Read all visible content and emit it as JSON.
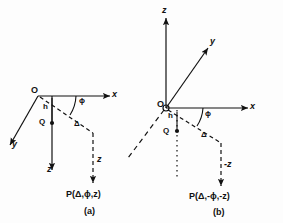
{
  "figure": {
    "background_color": "#fdfdfd",
    "stroke_color": "#111111",
    "panels": [
      {
        "id": "a",
        "caption": "(a)",
        "origin_label": "O",
        "axes": [
          {
            "name": "x-axis",
            "label": "x",
            "direction": "right",
            "style": "solid"
          },
          {
            "name": "y-axis",
            "label": "y",
            "direction": "down-left",
            "style": "solid"
          },
          {
            "name": "z-axis",
            "label": "z",
            "direction": "down",
            "style": "solid"
          }
        ],
        "annotations": [
          {
            "name": "height-label",
            "label": "h"
          },
          {
            "name": "point-q-label",
            "label": "Q"
          },
          {
            "name": "angle-phi-label",
            "label": "ϕ"
          },
          {
            "name": "radial-delta-label",
            "label": "Δ"
          },
          {
            "name": "depth-label",
            "label": "z"
          }
        ],
        "point_label": "P(Δ,ϕ,z)"
      },
      {
        "id": "b",
        "caption": "(b)",
        "origin_label": "O",
        "axes": [
          {
            "name": "x-axis",
            "label": "x",
            "direction": "right",
            "style": "solid"
          },
          {
            "name": "y-axis",
            "label": "y",
            "direction": "up-right",
            "style": "solid"
          },
          {
            "name": "z-axis",
            "label": "z",
            "direction": "up",
            "style": "solid"
          },
          {
            "name": "negative-y-axis",
            "label": "",
            "direction": "down-left",
            "style": "dashed"
          },
          {
            "name": "negative-z-axis",
            "label": "",
            "direction": "down",
            "style": "dotted"
          }
        ],
        "annotations": [
          {
            "name": "height-label",
            "label": "h"
          },
          {
            "name": "point-q-label",
            "label": "Q"
          },
          {
            "name": "angle-phi-label",
            "label": "ϕ"
          },
          {
            "name": "radial-delta-label",
            "label": "Δ"
          },
          {
            "name": "depth-label",
            "label": "-z"
          }
        ],
        "point_label": "P(Δ,-ϕ,-z)"
      }
    ]
  }
}
